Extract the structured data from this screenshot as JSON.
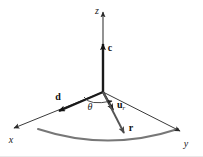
{
  "figure": {
    "background_color": "#ffffff",
    "width": 203,
    "height": 157
  },
  "colors": {
    "axis": "#3a3a3a",
    "vector_c": "#1a1a1a",
    "vector_d": "#1a1a1a",
    "vector_u": "#1a1a1a",
    "vector_r": "#555555",
    "arc": "#777777",
    "angle_arc": "#333333",
    "label": "#111111",
    "bottom_rule": "#e8e8e8"
  },
  "origin": {
    "x": 103,
    "y": 92
  },
  "axes": [
    {
      "name": "z-axis",
      "label": "z",
      "label_x": 97,
      "label_y": 14,
      "from": {
        "x": 103,
        "y": 92
      },
      "to": {
        "x": 103,
        "y": 12
      },
      "arrowhead": true
    },
    {
      "name": "x-axis",
      "label": "x",
      "label_x": 11,
      "label_y": 143,
      "from": {
        "x": 103,
        "y": 92
      },
      "to": {
        "x": 14,
        "y": 128
      },
      "arrowhead": true
    },
    {
      "name": "y-axis",
      "label": "y",
      "label_x": 186,
      "label_y": 147,
      "from": {
        "x": 103,
        "y": 92
      },
      "to": {
        "x": 180,
        "y": 131
      },
      "arrowhead": true
    }
  ],
  "vectors": [
    {
      "name": "vector-c",
      "label": "c",
      "subscript": "",
      "label_x": 110,
      "label_y": 51,
      "from": {
        "x": 103,
        "y": 92
      },
      "to": {
        "x": 103,
        "y": 44
      },
      "description": "unit vector along z (cone axis)"
    },
    {
      "name": "vector-d",
      "label": "d",
      "subscript": "",
      "label_x": 58,
      "label_y": 100,
      "from": {
        "x": 103,
        "y": 92
      },
      "to": {
        "x": 59,
        "y": 111
      },
      "description": "reference direction vector in the x-direction"
    },
    {
      "name": "vector-u-r",
      "label": "u",
      "subscript": "r",
      "label_x": 117,
      "label_y": 108,
      "from": {
        "x": 103,
        "y": 92
      },
      "to": {
        "x": 113,
        "y": 110
      },
      "description": "radial unit vector"
    },
    {
      "name": "vector-r",
      "label": "r",
      "subscript": "",
      "label_x": 131,
      "label_y": 131,
      "from": {
        "x": 103,
        "y": 92
      },
      "to": {
        "x": 124,
        "y": 133
      },
      "description": "position vector reaching the arc"
    }
  ],
  "angle": {
    "name": "theta",
    "label": "θ",
    "label_x": 90,
    "label_y": 110,
    "between": [
      "vector-d",
      "vector-u-r"
    ],
    "arc_from": {
      "x": 84,
      "y": 97
    },
    "arc_to": {
      "x": 112,
      "y": 101
    },
    "arrowhead": true
  },
  "arc": {
    "name": "base-arc",
    "from": {
      "x": 38,
      "y": 129
    },
    "control": {
      "x": 108,
      "y": 152
    },
    "to": {
      "x": 178,
      "y": 129
    },
    "stroke_width": 2,
    "description": "curved base of the spherical cap"
  }
}
